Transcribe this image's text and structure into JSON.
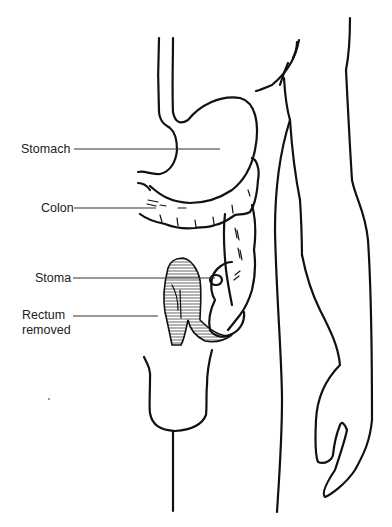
{
  "diagram": {
    "type": "anatomical illustration",
    "labels": [
      {
        "id": "stomach",
        "text": "Stomach",
        "x": 21,
        "y": 141
      },
      {
        "id": "colon",
        "text": "Colon",
        "x": 41,
        "y": 201
      },
      {
        "id": "stoma",
        "text": "Stoma",
        "x": 35,
        "y": 269
      },
      {
        "id": "rectum",
        "text": "Rectum",
        "x": 22,
        "y": 307
      },
      {
        "id": "removed",
        "text": "removed",
        "x": 22,
        "y": 322
      }
    ],
    "colors": {
      "line": "#111111",
      "hatch": "#555555",
      "background": "#ffffff"
    }
  }
}
